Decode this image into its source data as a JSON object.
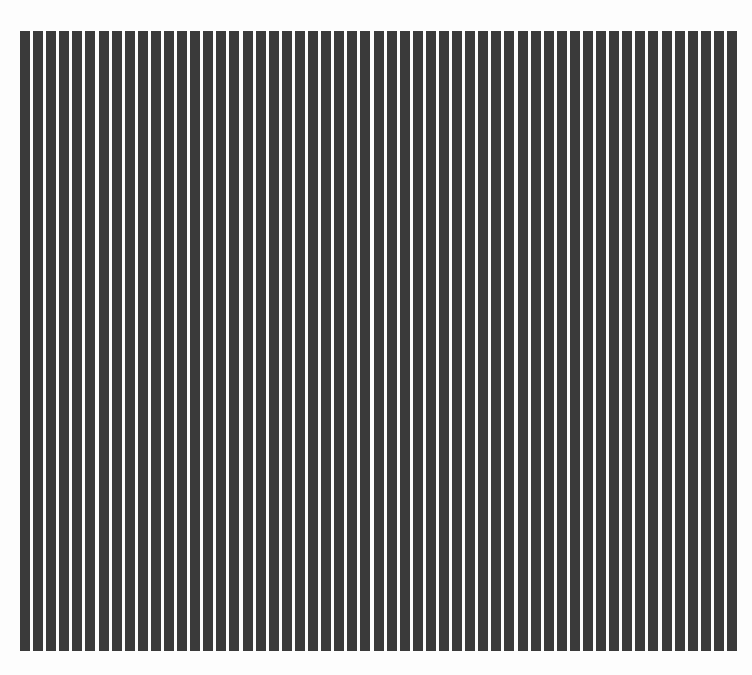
{
  "image": {
    "description": "Vertical black and white stripe grating pattern",
    "background_color": "#fdfdfd",
    "bar_color": "#3a3a3a"
  },
  "grating": {
    "bar_count": 55,
    "left": 20,
    "top": 31,
    "width": 717,
    "height": 620,
    "pitch": 13.04,
    "bar_width": 10
  }
}
